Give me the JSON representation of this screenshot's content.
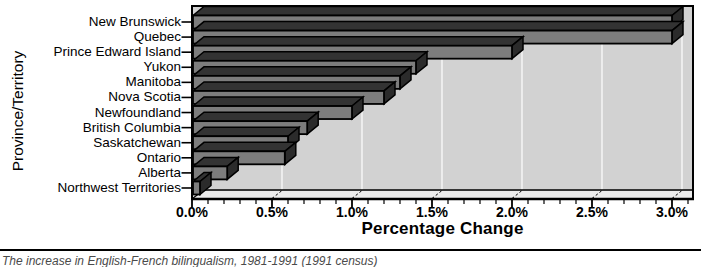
{
  "chart_data": {
    "type": "bar",
    "orientation": "horizontal",
    "style": "3d-extruded-bars",
    "title": "",
    "xlabel": "Percentage Change",
    "ylabel": "Province/Territory",
    "categories": [
      "New Brunswick",
      "Quebec",
      "Prince Edward Island",
      "Yukon",
      "Manitoba",
      "Nova Scotia",
      "Newfoundland",
      "British Columbia",
      "Saskatchewan",
      "Ontario",
      "Alberta",
      "Northwest Territories"
    ],
    "values": [
      3.0,
      3.0,
      2.0,
      1.4,
      1.3,
      1.2,
      1.0,
      0.72,
      0.6,
      0.58,
      0.22,
      0.05
    ],
    "xlim": [
      0,
      3.0
    ],
    "x_major_tick_step": 0.5,
    "x_minor_tick_step": 0.1,
    "x_tick_labels": [
      "0.0%",
      "0.5%",
      "1.0%",
      "1.5%",
      "2.0%",
      "2.5%",
      "3.0%"
    ],
    "grid": true,
    "legend": false,
    "colors": {
      "bar_front": "#7d7d7d",
      "bar_top": "#333333",
      "bar_side": "#2b2b2b",
      "outline": "#000000",
      "plot_bg": "#d2d2d2",
      "floor": "#ececec",
      "gridline": "#f8f8f8",
      "background": "#ffffff"
    }
  },
  "caption": {
    "text": "The increase in English-French bilingualism, 1981-1991 (1991 census)"
  }
}
